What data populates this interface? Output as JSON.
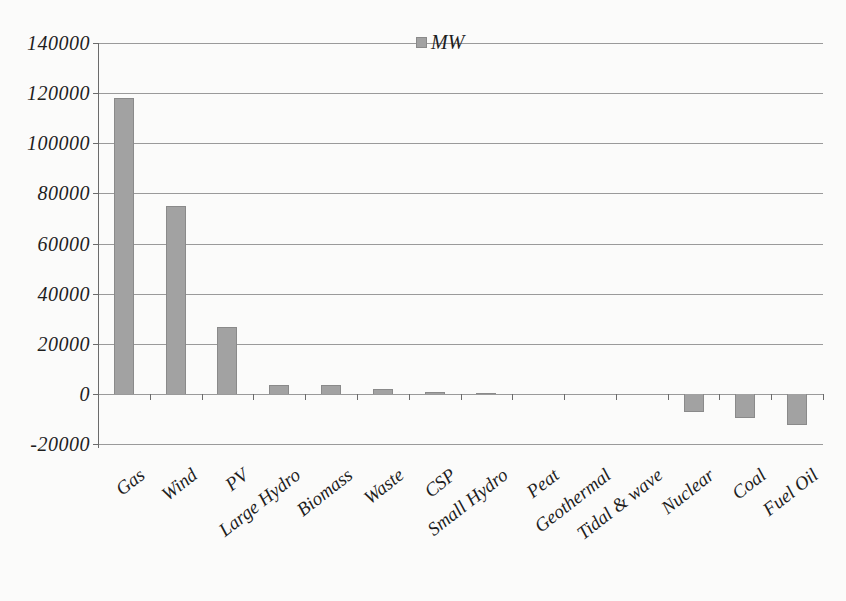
{
  "chart_data": {
    "type": "bar",
    "title": "",
    "xlabel": "",
    "ylabel": "",
    "legend": {
      "label": "MW",
      "position": "top-center"
    },
    "categories": [
      "Gas",
      "Wind",
      "PV",
      "Large Hydro",
      "Biomass",
      "Waste",
      "CSP",
      "Small Hydro",
      "Peat",
      "Geothermal",
      "Tidal & wave",
      "Nuclear",
      "Coal",
      "Fuel Oil"
    ],
    "values": [
      118000,
      74800,
      26500,
      3500,
      3700,
      2000,
      600,
      300,
      0,
      100,
      0,
      -7200,
      -9500,
      -12500
    ],
    "ylim": [
      -20000,
      140000
    ],
    "ytick_interval": 20000,
    "yticks": [
      140000,
      120000,
      100000,
      80000,
      60000,
      40000,
      20000,
      0,
      -20000
    ],
    "grid": true,
    "colors": {
      "bar_fill": "#a2a2a2",
      "bar_border": "#8a8a8a",
      "gridline": "#8f8f8f",
      "axis": "#6b6b6b",
      "text": "#1e1e1e",
      "background": "#fbfbfa"
    }
  }
}
